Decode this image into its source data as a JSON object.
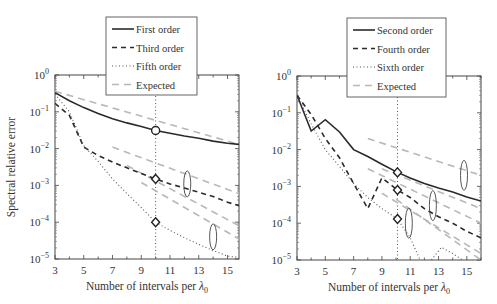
{
  "chart_data": [
    {
      "type": "line",
      "panel": "left",
      "xlabel": "Number of intervals per λ0",
      "ylabel": "Spectral relative error",
      "xlim": [
        3,
        15.8
      ],
      "ylim": [
        1e-05,
        1
      ],
      "yscale": "log",
      "xticks": [
        3,
        5,
        7,
        9,
        11,
        13,
        15
      ],
      "yticks": [
        "10^0",
        "10^-1",
        "10^-2",
        "10^-3",
        "10^-4",
        "10^-5"
      ],
      "legend": [
        "First order",
        "Third order",
        "Fifth order",
        "Expected"
      ],
      "legend_position": "top-center",
      "reference_line_x": 10,
      "series": [
        {
          "name": "First order",
          "style": "solid",
          "x": [
            3,
            4,
            5,
            6,
            7,
            8,
            9,
            10,
            11,
            12,
            13,
            14,
            15,
            15.8
          ],
          "y": [
            0.33,
            0.2,
            0.13,
            0.09,
            0.065,
            0.05,
            0.04,
            0.031,
            0.026,
            0.022,
            0.019,
            0.016,
            0.014,
            0.013
          ]
        },
        {
          "name": "Third order",
          "style": "dashed",
          "x": [
            3,
            4,
            5,
            6,
            7,
            8,
            9,
            10,
            11,
            12,
            13,
            14,
            15,
            15.8
          ],
          "y": [
            0.17,
            0.08,
            0.011,
            0.0065,
            0.0043,
            0.003,
            0.0021,
            0.0015,
            0.0011,
            0.00085,
            0.00065,
            0.0005,
            0.00035,
            0.00028
          ]
        },
        {
          "name": "Fifth order",
          "style": "dotted",
          "x": [
            3,
            4,
            5,
            6,
            7,
            8,
            9,
            10,
            11,
            12,
            13,
            14,
            15,
            15.8
          ],
          "y": [
            0.3,
            0.1,
            0.012,
            0.0045,
            0.0015,
            0.0006,
            0.00025,
            0.0001,
            6e-05,
            3.8e-05,
            2.5e-05,
            1.7e-05,
            1.2e-05,
            1.1e-05
          ]
        },
        {
          "name": "Expected (first)",
          "style": "dashed-gray",
          "x": [
            3,
            15.8
          ],
          "y": [
            0.36,
            0.013
          ]
        },
        {
          "name": "Expected (third a)",
          "style": "dashed-gray",
          "x": [
            7,
            15.8
          ],
          "y": [
            0.011,
            0.0006
          ]
        },
        {
          "name": "Expected (third b)",
          "style": "dashed-gray",
          "x": [
            8,
            15.8
          ],
          "y": [
            0.0035,
            8e-05
          ]
        },
        {
          "name": "Expected (fifth)",
          "style": "dashed-gray",
          "x": [
            9,
            15.8
          ],
          "y": [
            0.0012,
            3.5e-05
          ]
        }
      ],
      "markers": [
        {
          "shape": "circle",
          "x": 10,
          "y": 0.031
        },
        {
          "shape": "diamond",
          "x": 10,
          "y": 0.0015
        },
        {
          "shape": "diamond",
          "x": 10,
          "y": 0.0001
        }
      ],
      "ellipses": [
        {
          "x": 12.2,
          "y_center": 0.0011
        },
        {
          "x": 14.0,
          "y_center": 4e-05
        }
      ]
    },
    {
      "type": "line",
      "panel": "right",
      "xlabel": "Number of intervals per λ0",
      "ylabel": "",
      "xlim": [
        3,
        16
      ],
      "ylim": [
        1e-05,
        1
      ],
      "yscale": "log",
      "xticks": [
        3,
        5,
        7,
        9,
        11,
        13,
        15
      ],
      "yticks": [
        "10^0",
        "10^-1",
        "10^-2",
        "10^-3",
        "10^-4",
        "10^-5"
      ],
      "legend": [
        "Second order",
        "Fourth order",
        "Sixth order",
        "Expected"
      ],
      "legend_position": "top-center",
      "reference_line_x": 10.1,
      "series": [
        {
          "name": "Second order",
          "style": "solid",
          "x": [
            3,
            4,
            5,
            6,
            7,
            8,
            9,
            10.1,
            11,
            12,
            13,
            14,
            15,
            16
          ],
          "y": [
            0.3,
            0.032,
            0.065,
            0.03,
            0.01,
            0.0065,
            0.004,
            0.0024,
            0.0017,
            0.0012,
            0.0009,
            0.0007,
            0.00052,
            0.0004
          ]
        },
        {
          "name": "Fourth order",
          "style": "dashed",
          "x": [
            3,
            4,
            5,
            6,
            7,
            8,
            9,
            10.1,
            11,
            12,
            13,
            14,
            15,
            16
          ],
          "y": [
            0.3,
            0.09,
            0.02,
            0.006,
            0.0012,
            0.00025,
            0.0017,
            0.0008,
            0.0005,
            0.00025,
            0.00015,
            0.0001,
            6e-05,
            4e-05
          ]
        },
        {
          "name": "Sixth order",
          "style": "dotted",
          "x": [
            3,
            4,
            5,
            6,
            7,
            8,
            9,
            10.1,
            11,
            11.7
          ],
          "y": [
            0.3,
            0.05,
            0.01,
            0.0035,
            0.0012,
            0.0005,
            0.00025,
            0.00013,
            4e-05,
            1e-05
          ]
        },
        {
          "name": "Sixth order (tail)",
          "style": "dotted",
          "x": [
            12.5,
            13.2,
            14,
            14.7
          ],
          "y": [
            1e-05,
            2.2e-05,
            1.5e-05,
            1e-05
          ]
        },
        {
          "name": "Expected (second)",
          "style": "dashed-gray",
          "x": [
            8,
            16
          ],
          "y": [
            0.02,
            0.002
          ]
        },
        {
          "name": "Expected (second b)",
          "style": "dashed-gray",
          "x": [
            9,
            16
          ],
          "y": [
            0.003,
            0.00025
          ]
        },
        {
          "name": "Expected (fourth a)",
          "style": "dashed-gray",
          "x": [
            8,
            16
          ],
          "y": [
            0.003,
            0.0001
          ]
        },
        {
          "name": "Expected (fourth b)",
          "style": "dashed-gray",
          "x": [
            9,
            16
          ],
          "y": [
            0.00065,
            1.5e-05
          ]
        },
        {
          "name": "Expected (sixth)",
          "style": "dashed-gray",
          "x": [
            10,
            16
          ],
          "y": [
            0.00045,
            1e-05
          ]
        }
      ],
      "markers": [
        {
          "shape": "diamond",
          "x": 10.1,
          "y": 0.0024
        },
        {
          "shape": "diamond",
          "x": 10.1,
          "y": 0.0008
        },
        {
          "shape": "diamond",
          "x": 10.1,
          "y": 0.00013
        }
      ],
      "ellipses": [
        {
          "x": 10.9,
          "y_center": 0.0001
        },
        {
          "x": 12.6,
          "y_center": 0.0003
        },
        {
          "x": 14.8,
          "y_center": 0.002
        }
      ]
    }
  ],
  "labels": {
    "ylabel": "Spectral relative error",
    "xlabel_main": "Number of intervals per ",
    "xlabel_sym": "λ",
    "xlabel_sub": "0",
    "ytick_base": "10",
    "yticks_exp": [
      "0",
      "−1",
      "−2",
      "−3",
      "−4",
      "−5"
    ],
    "xticks": [
      "3",
      "5",
      "7",
      "9",
      "11",
      "13",
      "15"
    ],
    "left_legend": [
      "First order",
      "Third order",
      "Fifth order",
      "Expected"
    ],
    "right_legend": [
      "Second order",
      "Fourth order",
      "Sixth order",
      "Expected"
    ]
  }
}
